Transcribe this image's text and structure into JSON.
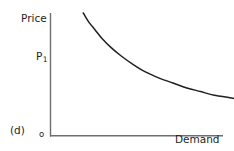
{
  "figure": {
    "panel_label": "(d)",
    "origin_label": "o",
    "background_color": "#ffffff",
    "ink_color": "#231f20"
  },
  "chart_data": {
    "type": "line",
    "title": "",
    "subtitle": "",
    "panel": "(d)",
    "xlabel": "Demand",
    "ylabel": "Price",
    "origin_label": "o",
    "grid": false,
    "legend": "none",
    "axis_color": "#6d6e71",
    "curve_color": "#231f20",
    "xlim": [
      0,
      100
    ],
    "ylim": [
      0,
      100
    ],
    "axes_note": "Axes drawn as plain lines with no tick marks and no numeric tick labels.",
    "annotations": [
      {
        "name": "price-level-p1",
        "text": "P1",
        "display_text": "P₁",
        "base": "P",
        "subscript": "1",
        "axis": "y",
        "value": 68,
        "position": "y-axis label, left of vertical axis"
      }
    ],
    "series": [
      {
        "name": "Demand curve",
        "label": "",
        "shape": "downward-sloping convex curve",
        "x": [
          19,
          22,
          26,
          30,
          35,
          41,
          48,
          55,
          63,
          71,
          79,
          87,
          95,
          104,
          112,
          120,
          127,
          134,
          141,
          148,
          155,
          162,
          168
        ],
        "y": [
          100,
          93,
          86,
          79,
          72,
          65,
          58,
          52,
          47,
          43,
          39,
          36,
          33,
          31,
          29,
          28,
          27,
          26,
          25,
          25,
          24,
          24,
          24
        ]
      }
    ]
  },
  "labels": {
    "panel": "(d)",
    "y_axis_title": "Price",
    "x_axis_title": "Demand",
    "origin": "o",
    "price_level_base": "P",
    "price_level_sub": "1"
  }
}
